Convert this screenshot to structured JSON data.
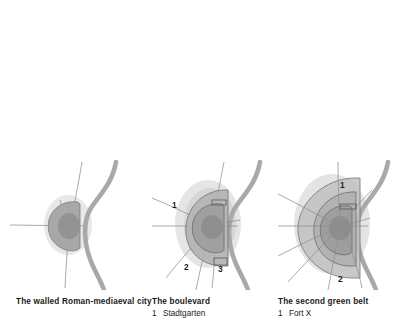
{
  "figure": {
    "title_hidden": "",
    "background_color": "#ffffff",
    "panel_count": 3
  },
  "palette": {
    "river": "#a9a9a9",
    "road": "#8e8e8e",
    "halo": "#c9c9c9",
    "ring_outer": "#bdbdbd",
    "ring_mid": "#b0b0b0",
    "core": "#9b9b9b",
    "core_dark": "#8d8d8d",
    "outline": "#6f6f6f",
    "text": "#1a1a1a"
  },
  "panels": [
    {
      "id": "panel-1",
      "caption": "The walled Roman-mediaeval city",
      "legend": [],
      "markers": [],
      "features": [
        "river",
        "radial-roads",
        "walled-core"
      ]
    },
    {
      "id": "panel-2",
      "caption": "The boulevard",
      "legend": [
        {
          "num": "1",
          "text": "Stadtgarten"
        }
      ],
      "markers": [
        "1",
        "2",
        "3"
      ],
      "features": [
        "river",
        "radial-roads",
        "walled-core",
        "boulevard-ring",
        "halo"
      ]
    },
    {
      "id": "panel-3",
      "caption": "The second green belt",
      "legend": [
        {
          "num": "1",
          "text": "Fort X"
        }
      ],
      "markers": [
        "1",
        "2"
      ],
      "features": [
        "river",
        "radial-roads",
        "walled-core",
        "boulevard-ring",
        "green-belt",
        "halo"
      ]
    }
  ]
}
